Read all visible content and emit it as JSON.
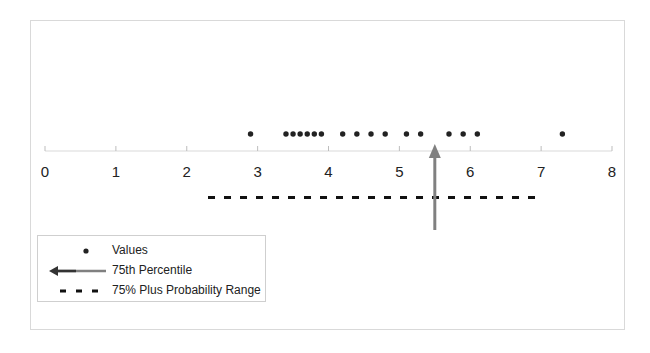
{
  "chart_data": {
    "type": "scatter",
    "title": "",
    "xlabel": "",
    "ylabel": "",
    "xlim": [
      0,
      8
    ],
    "x_ticks": [
      "0",
      "1",
      "2",
      "3",
      "4",
      "5",
      "6",
      "7",
      "8"
    ],
    "grid": false,
    "legend_position": "bottom-left inside",
    "series": [
      {
        "name": "Values",
        "marker": "dot",
        "values": [
          2.9,
          3.4,
          3.5,
          3.6,
          3.7,
          3.8,
          3.9,
          4.2,
          4.4,
          4.6,
          4.8,
          5.1,
          5.3,
          5.7,
          5.9,
          6.1,
          7.3
        ]
      },
      {
        "name": "75th Percentile",
        "marker": "arrow",
        "value": 5.5
      },
      {
        "name": "75% Plus Probability Range",
        "marker": "dashed-line",
        "range": [
          2.3,
          7.0
        ]
      }
    ],
    "colors": {
      "values": "#222222",
      "percentile_arrow": "#808080",
      "range_line": "#111111",
      "axis": "#d9d9d9"
    }
  },
  "legend": {
    "items": [
      {
        "label": "Values"
      },
      {
        "label": "75th Percentile"
      },
      {
        "label": "75% Plus Probability Range"
      }
    ]
  }
}
